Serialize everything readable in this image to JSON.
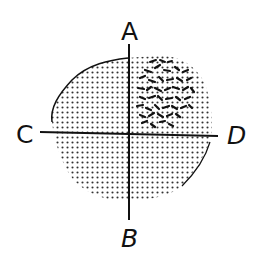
{
  "diagram": {
    "labels": {
      "top": "A",
      "bottom": "B",
      "left": "C",
      "right": "D"
    },
    "colors": {
      "ink": "#111111",
      "dot": "#333333",
      "background": "#ffffff"
    }
  }
}
